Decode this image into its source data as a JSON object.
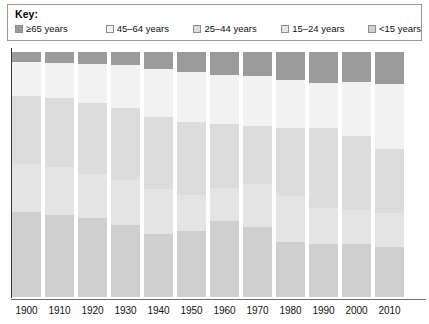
{
  "legend": {
    "title": "Key:",
    "items": [
      {
        "label": "≥65 years",
        "color": "#9b9b9b"
      },
      {
        "label": "45–64 years",
        "color": "#f2f2f2"
      },
      {
        "label": "25–44 years",
        "color": "#dcdcdc"
      },
      {
        "label": "15–24 years",
        "color": "#e4e4e4"
      },
      {
        "label": "<15 years",
        "color": "#cfcfcf"
      }
    ]
  },
  "chart_data": {
    "type": "bar",
    "stacked": true,
    "stack_mode": "percent",
    "title": "",
    "xlabel": "",
    "ylabel": "",
    "ylim": [
      0,
      100
    ],
    "grid": false,
    "legend_position": "top",
    "categories": [
      "1900",
      "1910",
      "1920",
      "1930",
      "1940",
      "1950",
      "1960",
      "1970",
      "1980",
      "1990",
      "2000",
      "2010"
    ],
    "series": [
      {
        "name": "≥65 years",
        "color": "#9b9b9b",
        "values": [
          4.1,
          4.3,
          4.7,
          5.4,
          6.8,
          8.1,
          9.2,
          9.8,
          11.3,
          12.5,
          12.4,
          13.1
        ]
      },
      {
        "name": "45–64 years",
        "color": "#f2f2f2",
        "values": [
          13.7,
          14.6,
          16.1,
          17.4,
          19.8,
          20.3,
          20.1,
          20.6,
          19.6,
          18.6,
          22.0,
          26.4
        ]
      },
      {
        "name": "25–44 years",
        "color": "#dcdcdc",
        "values": [
          27.9,
          28.1,
          29.2,
          29.5,
          29.5,
          30.0,
          26.2,
          23.6,
          27.7,
          32.5,
          29.9,
          26.1
        ]
      },
      {
        "name": "15–24 years",
        "color": "#e4e4e4",
        "values": [
          19.6,
          19.7,
          17.7,
          18.3,
          18.2,
          14.7,
          13.4,
          17.4,
          18.8,
          14.8,
          13.9,
          14.0
        ]
      },
      {
        "name": "<15 years",
        "color": "#cfcfcf",
        "values": [
          34.7,
          33.3,
          32.3,
          29.4,
          25.7,
          26.9,
          31.1,
          28.6,
          22.6,
          21.6,
          21.8,
          20.4
        ]
      }
    ]
  },
  "axis": {
    "tick_labels": [
      "1900",
      "1910",
      "1920",
      "1930",
      "1940",
      "1950",
      "1960",
      "1970",
      "1980",
      "1990",
      "2000",
      "2010"
    ]
  }
}
